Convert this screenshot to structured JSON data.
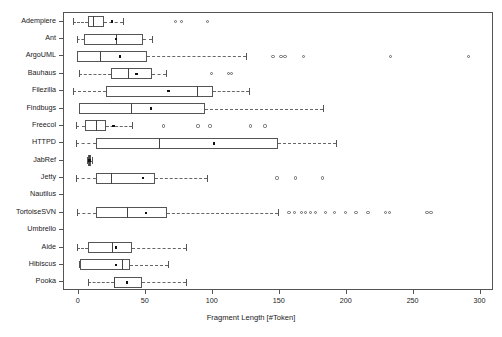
{
  "chart_data": {
    "type": "box",
    "title": "",
    "xlabel": "Fragment Length [#Token]",
    "ylabel": "",
    "xlim": [
      -11,
      310
    ],
    "xticks": [
      0,
      50,
      100,
      150,
      200,
      250,
      300
    ],
    "xtick_labels": [
      "0",
      "50",
      "100",
      "150",
      "200",
      "250",
      "300"
    ],
    "grid": false,
    "legend": null,
    "orientation": "horizontal",
    "categories": [
      "Adempiere",
      "Ant",
      "ArgoUML",
      "Bauhaus",
      "Filezilla",
      "Findbugs",
      "Freecol",
      "HTTPD",
      "JabRef",
      "Jetty",
      "Nautilus",
      "TortoiseSVN",
      "Umbrello",
      "Aide",
      "Hibiscus",
      "Pooka"
    ],
    "boxes": [
      {
        "category": "Adempiere",
        "whisker_low": -4,
        "q1": 7,
        "median": 11,
        "q3": 19,
        "whisker_high": 33,
        "mean": 25,
        "outliers": [
          72,
          77,
          96
        ]
      },
      {
        "category": "Ant",
        "whisker_low": -1,
        "q1": 4,
        "median": 28,
        "q3": 48,
        "whisker_high": 55,
        "mean": 28,
        "outliers": []
      },
      {
        "category": "ArgoUML",
        "whisker_low": -1,
        "q1": -1,
        "median": 16,
        "q3": 51,
        "whisker_high": 125,
        "mean": 31,
        "outliers": [
          145,
          151,
          154,
          168,
          233,
          291
        ]
      },
      {
        "category": "Bauhaus",
        "whisker_low": 0,
        "q1": 24,
        "median": 37,
        "q3": 55,
        "whisker_high": 65,
        "mean": 43,
        "outliers": [
          99,
          112,
          114
        ]
      },
      {
        "category": "Filezilla",
        "whisker_low": -4,
        "q1": 20,
        "median": 88,
        "q3": 100,
        "whisker_high": 127,
        "mean": 67,
        "outliers": []
      },
      {
        "category": "Findbugs",
        "whisker_low": 0,
        "q1": 0,
        "median": 39,
        "q3": 94,
        "whisker_high": 182,
        "mean": 54,
        "outliers": []
      },
      {
        "category": "Freecol",
        "whisker_low": -2,
        "q1": 5,
        "median": 13,
        "q3": 20,
        "whisker_high": 40,
        "mean": 26,
        "outliers": [
          63,
          89,
          98,
          128,
          139
        ]
      },
      {
        "category": "HTTPD",
        "whisker_low": -2,
        "q1": 13,
        "median": 60,
        "q3": 149,
        "whisker_high": 192,
        "mean": 101,
        "outliers": []
      },
      {
        "category": "JabRef",
        "whisker_low": 6,
        "q1": 7,
        "median": 8,
        "q3": 9,
        "whisker_high": 10,
        "mean": 8,
        "outliers": []
      },
      {
        "category": "Jetty",
        "whisker_low": -2,
        "q1": 13,
        "median": 24,
        "q3": 57,
        "whisker_high": 96,
        "mean": 48,
        "outliers": [
          148,
          162,
          182
        ]
      },
      {
        "category": "Nautilus",
        "whisker_low": null,
        "q1": null,
        "median": null,
        "q3": null,
        "whisker_high": null,
        "mean": null,
        "outliers": []
      },
      {
        "category": "TortoiseSVN",
        "whisker_low": -1,
        "q1": 13,
        "median": 36,
        "q3": 66,
        "whisker_high": 149,
        "mean": 50,
        "outliers": [
          157,
          161,
          166,
          169,
          173,
          177,
          184,
          191,
          199,
          207,
          216,
          229,
          232,
          260,
          263
        ]
      },
      {
        "category": "Umbrello",
        "whisker_low": null,
        "q1": null,
        "median": null,
        "q3": null,
        "whisker_high": null,
        "mean": null,
        "outliers": []
      },
      {
        "category": "Aide",
        "whisker_low": -1,
        "q1": 7,
        "median": 25,
        "q3": 40,
        "whisker_high": 80,
        "mean": 28,
        "outliers": []
      },
      {
        "category": "Hibiscus",
        "whisker_low": 0,
        "q1": 1,
        "median": 32,
        "q3": 38,
        "whisker_high": 67,
        "mean": 28,
        "outliers": []
      },
      {
        "category": "Pooka",
        "whisker_low": 7,
        "q1": 26,
        "median": 26,
        "q3": 47,
        "whisker_high": 80,
        "mean": 36,
        "outliers": []
      }
    ]
  }
}
